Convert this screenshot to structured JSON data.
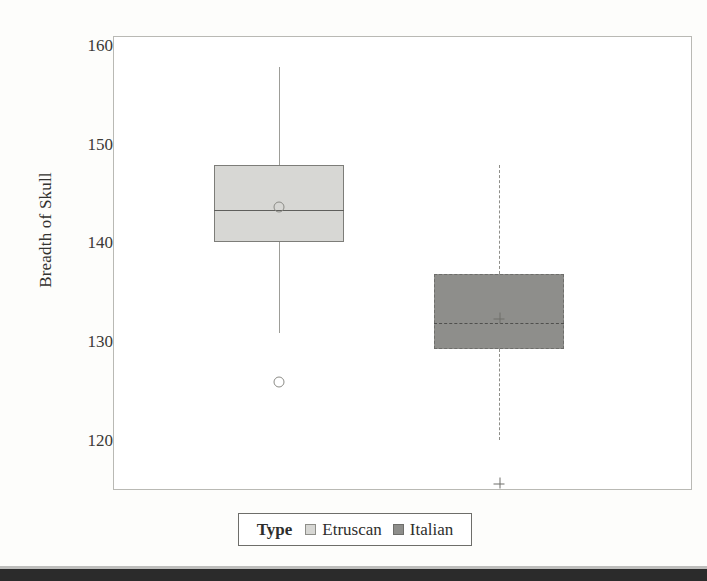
{
  "chart_data": {
    "type": "box",
    "title": "",
    "xlabel": "",
    "ylabel": "Breadth of Skull",
    "ylim": [
      115,
      161
    ],
    "yticks": [
      160,
      150,
      140,
      130,
      120
    ],
    "ytick_labels": [
      "160",
      "150",
      "140",
      "130",
      "120"
    ],
    "grid": false,
    "legend_position": "bottom",
    "legend_title": "Type",
    "categories": [
      "Etruscan",
      "Italian"
    ],
    "series": [
      {
        "name": "Etruscan",
        "fill_color": "#d7d7d4",
        "line_style": "solid",
        "marker": "circle",
        "whisker_low": 131,
        "q1": 140.2,
        "median": 143.5,
        "mean": 143.8,
        "q3": 148,
        "whisker_high": 158,
        "outliers": [
          126
        ]
      },
      {
        "name": "Italian",
        "fill_color": "#8e8e8b",
        "line_style": "dashed",
        "marker": "plus",
        "whisker_low": 120.2,
        "q1": 129.4,
        "median": 132,
        "mean": 132.5,
        "q3": 137,
        "whisker_high": 148,
        "outliers": [
          115.8
        ]
      }
    ]
  },
  "axis": {
    "y_title": "Breadth of Skull",
    "tick_labels": [
      "160",
      "150",
      "140",
      "130",
      "120"
    ]
  },
  "legend": {
    "title": "Type",
    "entries": [
      {
        "label": "Etruscan",
        "swatch": "light-gray-square"
      },
      {
        "label": "Italian",
        "swatch": "dark-gray-square"
      }
    ]
  },
  "colors": {
    "etruscan_fill": "#d7d7d4",
    "italian_fill": "#8e8e8b",
    "frame": "#b9b9b4",
    "text": "#33322f"
  }
}
